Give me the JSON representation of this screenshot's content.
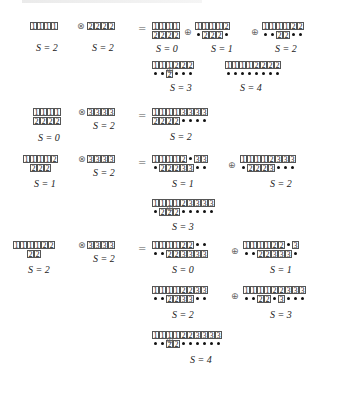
{
  "symbols": {
    "tensor": "⊗",
    "oplus": "⊕",
    "equals": "="
  },
  "sections": [
    {
      "lhs": [
        {
          "rows": [
            [
              "1",
              "1",
              "1",
              "1"
            ]
          ],
          "label": "S = 2"
        },
        {
          "rows": [
            [
              "2",
              "2",
              "2",
              "2"
            ]
          ],
          "label": "S = 2"
        }
      ],
      "terms": [
        {
          "rows": [
            [
              "1",
              "1",
              "1",
              "1"
            ],
            [
              "2",
              "2",
              "2",
              "2"
            ]
          ],
          "label": "S = 0"
        },
        {
          "rows": [
            [
              "1",
              "1",
              "1",
              "1",
              "2"
            ],
            [
              "•",
              "2",
              "2",
              "2",
              "•"
            ]
          ],
          "label": "S = 1"
        },
        {
          "rows": [
            [
              "1",
              "1",
              "1",
              "1",
              "2",
              "2"
            ],
            [
              "•",
              "•",
              "2",
              "2",
              "•",
              "•"
            ]
          ],
          "label": "S = 2"
        },
        {
          "rows": [
            [
              "1",
              "1",
              "1",
              "2",
              "2",
              "2"
            ],
            [
              "•",
              "•",
              "2",
              "•",
              "•",
              "•"
            ]
          ],
          "label": "S = 3"
        },
        {
          "rows": [
            [
              "1",
              "1",
              "1",
              "1",
              "2",
              "2",
              "2",
              "2"
            ],
            [
              "•",
              "•",
              "•",
              "•",
              "•",
              "•",
              "•",
              "•"
            ]
          ],
          "label": "S = 4"
        }
      ]
    },
    {
      "lhs": [
        {
          "rows": [
            [
              "1",
              "1",
              "1",
              "1"
            ],
            [
              "2",
              "2",
              "2",
              "2"
            ]
          ],
          "label": "S = 0"
        },
        {
          "rows": [
            [
              "3",
              "3",
              "3",
              "3"
            ]
          ],
          "label": "S = 2"
        }
      ],
      "terms": [
        {
          "rows": [
            [
              "1",
              "1",
              "1",
              "1",
              "3",
              "3",
              "3",
              "3"
            ],
            [
              "2",
              "2",
              "2",
              "2",
              "•",
              "•",
              "•",
              "•"
            ]
          ],
          "label": "S = 2"
        }
      ]
    },
    {
      "lhs": [
        {
          "rows": [
            [
              "1",
              "1",
              "1",
              "1",
              "2"
            ],
            [
              " ",
              "2",
              "2",
              "2"
            ]
          ],
          "label": "S = 1"
        },
        {
          "rows": [
            [
              "3",
              "3",
              "3",
              "3"
            ]
          ],
          "label": "S = 2"
        }
      ],
      "terms": [
        {
          "rows": [
            [
              "1",
              "1",
              "1",
              "1",
              "2",
              "•",
              "3",
              "3"
            ],
            [
              "•",
              "2",
              "2",
              "2",
              "3",
              "3",
              "•",
              "•"
            ]
          ],
          "label": "S = 1"
        },
        {
          "rows": [
            [
              "1",
              "1",
              "1",
              "1",
              "2",
              "3",
              "3",
              "3"
            ],
            [
              "•",
              "2",
              "2",
              "2",
              "3",
              "•",
              "•",
              "•"
            ]
          ],
          "label": "S = 2"
        },
        {
          "rows": [
            [
              "1",
              "1",
              "1",
              "1",
              "2",
              "3",
              "3",
              "3",
              "3"
            ],
            [
              "•",
              "2",
              "2",
              "2",
              "•",
              "•",
              "•",
              "•",
              "•"
            ]
          ],
          "label": "S = 3"
        }
      ]
    },
    {
      "lhs": [
        {
          "rows": [
            [
              "1",
              "1",
              "1",
              "1",
              "2",
              "2"
            ],
            [
              " ",
              " ",
              "2",
              "2"
            ]
          ],
          "label": "S = 2"
        },
        {
          "rows": [
            [
              "3",
              "3",
              "3",
              "3"
            ]
          ],
          "label": "S = 2"
        }
      ],
      "terms": [
        {
          "rows": [
            [
              "1",
              "1",
              "1",
              "1",
              "2",
              "2",
              "•",
              "•"
            ],
            [
              "•",
              "•",
              "2",
              "2",
              "3",
              "3",
              "3",
              "3"
            ]
          ],
          "label": "S = 0"
        },
        {
          "rows": [
            [
              "1",
              "1",
              "1",
              "1",
              "2",
              "2",
              "•",
              "3"
            ],
            [
              "•",
              "•",
              "2",
              "2",
              "3",
              "3",
              "3",
              "•"
            ]
          ],
          "label": "S = 1"
        },
        {
          "rows": [
            [
              "1",
              "1",
              "1",
              "1",
              "2",
              "2",
              "3",
              "3"
            ],
            [
              "•",
              "•",
              "2",
              "2",
              "3",
              "3",
              "•",
              "•"
            ]
          ],
          "label": "S = 2"
        },
        {
          "rows": [
            [
              "1",
              "1",
              "1",
              "1",
              "2",
              "2",
              "3",
              "3",
              "3"
            ],
            [
              "•",
              "•",
              "2",
              "2",
              "•",
              "3",
              "•",
              "•",
              "•"
            ]
          ],
          "label": "S = 3"
        },
        {
          "rows": [
            [
              "1",
              "1",
              "1",
              "1",
              "2",
              "2",
              "3",
              "3",
              "3",
              "3"
            ],
            [
              "•",
              "•",
              "2",
              "2",
              "•",
              "•",
              "•",
              "•",
              "•",
              "•"
            ]
          ],
          "label": "S = 4"
        }
      ]
    }
  ],
  "layout": {
    "sections": [
      {
        "lhs_pos": [
          [
            30,
            22
          ],
          [
            87,
            22
          ]
        ],
        "lhs_lbl": [
          [
            36,
            42
          ],
          [
            92,
            42
          ]
        ],
        "tensor": [
          77,
          21
        ],
        "eq": [
          138,
          23
        ],
        "terms": [
          [
            152,
            22
          ],
          [
            195,
            22
          ],
          [
            262,
            22
          ],
          [
            152,
            61
          ],
          [
            225,
            61
          ]
        ],
        "labels": [
          [
            156,
            43
          ],
          [
            211,
            43
          ],
          [
            275,
            43
          ],
          [
            170,
            82
          ],
          [
            240,
            82
          ]
        ],
        "oplus": [
          [
            184,
            27
          ],
          [
            251,
            27
          ],
          [
            166,
            65
          ]
        ]
      },
      {
        "lhs_pos": [
          [
            33,
            108
          ],
          [
            87,
            108
          ]
        ],
        "lhs_lbl": [
          [
            38,
            132
          ],
          [
            93,
            120
          ]
        ],
        "tensor": [
          78,
          107
        ],
        "eq": [
          138,
          110
        ],
        "terms": [
          [
            152,
            108
          ]
        ],
        "labels": [
          [
            170,
            131
          ]
        ],
        "oplus": []
      },
      {
        "lhs_pos": [
          [
            23,
            155
          ],
          [
            87,
            155
          ]
        ],
        "lhs_lbl": [
          [
            34,
            178
          ],
          [
            93,
            167
          ]
        ],
        "tensor": [
          78,
          154
        ],
        "eq": [
          138,
          157
        ],
        "terms": [
          [
            152,
            155
          ],
          [
            240,
            155
          ],
          [
            152,
            199
          ]
        ],
        "labels": [
          [
            172,
            178
          ],
          [
            270,
            178
          ],
          [
            172,
            221
          ]
        ],
        "oplus": [
          [
            228,
            160
          ],
          [
            166,
            203
          ]
        ]
      },
      {
        "lhs_pos": [
          [
            13,
            241
          ],
          [
            87,
            241
          ]
        ],
        "lhs_lbl": [
          [
            28,
            264
          ],
          [
            93,
            253
          ]
        ],
        "tensor": [
          78,
          240
        ],
        "eq": [
          138,
          243
        ],
        "terms": [
          [
            152,
            241
          ],
          [
            243,
            241
          ],
          [
            152,
            286
          ],
          [
            243,
            286
          ],
          [
            152,
            331
          ]
        ],
        "labels": [
          [
            172,
            264
          ],
          [
            270,
            264
          ],
          [
            172,
            309
          ],
          [
            270,
            309
          ],
          [
            190,
            354
          ]
        ],
        "oplus": [
          [
            231,
            246
          ],
          [
            231,
            291
          ],
          [
            166,
            335
          ]
        ]
      }
    ]
  }
}
